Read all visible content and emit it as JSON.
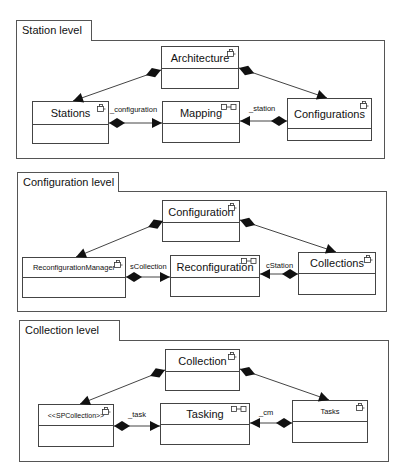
{
  "diagram": {
    "type": "uml-composite-structure",
    "colors": {
      "line": "#444444",
      "frame": "#555555",
      "fill": "#ffffff",
      "marker": "#111111"
    },
    "levels": [
      {
        "id": "station",
        "title": "Station level",
        "frame": {
          "x": 16,
          "y": 40,
          "w": 367,
          "h": 117
        },
        "tab": {
          "x": 16,
          "y": 20,
          "w": 76,
          "h": 21
        },
        "boxes": [
          {
            "id": "architecture",
            "label": "Architecture",
            "icon": "class-icon",
            "x": 161,
            "y": 46,
            "w": 78,
            "h": 43,
            "nameH": 22,
            "fontSize": 11
          },
          {
            "id": "stations",
            "label": "Stations",
            "icon": "class-icon",
            "x": 32,
            "y": 101,
            "w": 77,
            "h": 43,
            "nameH": 23,
            "fontSize": 11
          },
          {
            "id": "mapping",
            "label": "Mapping",
            "icon": "connector-icon",
            "x": 162,
            "y": 101,
            "w": 78,
            "h": 42,
            "nameH": 22,
            "fontSize": 11
          },
          {
            "id": "configurations",
            "label": "Configurations",
            "icon": "class-icon",
            "x": 287,
            "y": 98,
            "w": 85,
            "h": 43,
            "nameH": 30,
            "fontSize": 11
          }
        ],
        "edges": [
          {
            "from": "architecture",
            "to": "stations",
            "label": "",
            "x1": 161,
            "y1": 70,
            "x2": 73,
            "y2": 101
          },
          {
            "from": "architecture",
            "to": "configurations",
            "label": "",
            "x1": 239,
            "y1": 68,
            "x2": 327,
            "y2": 98
          },
          {
            "from": "stations",
            "to": "mapping",
            "label": "_configuration",
            "x1": 109,
            "y1": 123,
            "x2": 162,
            "y2": 123,
            "lx": 110,
            "ly": 105
          },
          {
            "from": "configurations",
            "to": "mapping",
            "label": "_station",
            "x1": 287,
            "y1": 121,
            "x2": 240,
            "y2": 121,
            "lx": 249,
            "ly": 104
          }
        ]
      },
      {
        "id": "configuration",
        "title": "Configuration level",
        "frame": {
          "x": 17,
          "y": 191,
          "w": 368,
          "h": 119
        },
        "tab": {
          "x": 17,
          "y": 172,
          "w": 102,
          "h": 20
        },
        "boxes": [
          {
            "id": "configuration",
            "label": "Configuration",
            "icon": "class-icon",
            "x": 162,
            "y": 200,
            "w": 78,
            "h": 42,
            "nameH": 22,
            "fontSize": 11
          },
          {
            "id": "reconfigurationmanager",
            "label": "ReconfigurationManager",
            "icon": "class-icon",
            "x": 22,
            "y": 257,
            "w": 104,
            "h": 41,
            "nameH": 20,
            "fontSize": 7.5
          },
          {
            "id": "reconfiguration",
            "label": "Reconfiguration",
            "icon": "connector-icon",
            "x": 170,
            "y": 255,
            "w": 90,
            "h": 42,
            "nameH": 22,
            "fontSize": 11
          },
          {
            "id": "collections",
            "label": "Collections",
            "icon": "class-icon",
            "x": 298,
            "y": 252,
            "w": 78,
            "h": 43,
            "nameH": 21,
            "fontSize": 11
          }
        ],
        "edges": [
          {
            "from": "configuration",
            "to": "reconfigurationmanager",
            "label": "",
            "x1": 163,
            "y1": 221,
            "x2": 76,
            "y2": 257
          },
          {
            "from": "configuration",
            "to": "collections",
            "label": "",
            "x1": 240,
            "y1": 220,
            "x2": 336,
            "y2": 252
          },
          {
            "from": "reconfigurationmanager",
            "to": "reconfiguration",
            "label": "sCollection",
            "x1": 126,
            "y1": 277,
            "x2": 170,
            "y2": 277,
            "lx": 130,
            "ly": 262
          },
          {
            "from": "collections",
            "to": "reconfiguration",
            "label": "cStation",
            "x1": 298,
            "y1": 274,
            "x2": 260,
            "y2": 274,
            "lx": 266,
            "ly": 261
          }
        ]
      },
      {
        "id": "collection",
        "title": "Collection level",
        "frame": {
          "x": 19,
          "y": 340,
          "w": 368,
          "h": 120
        },
        "tab": {
          "x": 19,
          "y": 320,
          "w": 101,
          "h": 21
        },
        "boxes": [
          {
            "id": "collection",
            "label": "Collection",
            "icon": "class-icon",
            "x": 165,
            "y": 349,
            "w": 75,
            "h": 42,
            "nameH": 22,
            "fontSize": 11
          },
          {
            "id": "spcollection",
            "label": "<<SPCollection>>",
            "icon": "class-icon",
            "x": 38,
            "y": 404,
            "w": 76,
            "h": 43,
            "nameH": 21,
            "fontSize": 7
          },
          {
            "id": "tasking",
            "label": "Tasking",
            "icon": "connector-icon",
            "x": 160,
            "y": 403,
            "w": 90,
            "h": 42,
            "nameH": 21,
            "fontSize": 11
          },
          {
            "id": "tasks",
            "label": "Tasks",
            "icon": "class-icon",
            "x": 292,
            "y": 400,
            "w": 76,
            "h": 43,
            "nameH": 21,
            "fontSize": 7.5
          }
        ],
        "edges": [
          {
            "from": "collection",
            "to": "spcollection",
            "label": "",
            "x1": 165,
            "y1": 370,
            "x2": 80,
            "y2": 404
          },
          {
            "from": "collection",
            "to": "tasks",
            "label": "",
            "x1": 240,
            "y1": 369,
            "x2": 329,
            "y2": 400
          },
          {
            "from": "spcollection",
            "to": "tasking",
            "label": "_task",
            "x1": 114,
            "y1": 426,
            "x2": 160,
            "y2": 426,
            "lx": 128,
            "ly": 410
          },
          {
            "from": "tasks",
            "to": "tasking",
            "label": "_cm",
            "x1": 292,
            "y1": 423,
            "x2": 250,
            "y2": 423,
            "lx": 259,
            "ly": 408
          }
        ]
      }
    ]
  }
}
